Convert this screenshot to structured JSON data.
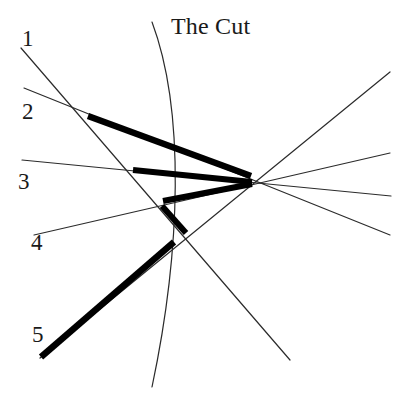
{
  "figure": {
    "title": "The Cut",
    "title_position": {
      "x": 171,
      "y": 14
    },
    "background_color": "#ffffff",
    "ink_color": "#1a1a1a",
    "thin_line_color": "#2b2b2b",
    "thick_line_color": "#000000",
    "width": 407,
    "height": 395
  },
  "convergence_point": {
    "x": 253,
    "y": 181
  },
  "labels": [
    {
      "name": "1",
      "x": 22,
      "y": 27
    },
    {
      "name": "2",
      "x": 22,
      "y": 100
    },
    {
      "name": "3",
      "x": 18,
      "y": 170
    },
    {
      "name": "4",
      "x": 31,
      "y": 231
    },
    {
      "name": "5",
      "x": 32,
      "y": 323
    }
  ],
  "cut_curve": {
    "label": "The Cut",
    "start": {
      "x": 152,
      "y": 22
    },
    "control1": {
      "x": 185,
      "y": 110
    },
    "control2": {
      "x": 181,
      "y": 250
    },
    "end": {
      "x": 152,
      "y": 387
    },
    "stroke_width": 1.2
  },
  "thin_lines": [
    {
      "name": "ray-1",
      "x1": 21,
      "y1": 48,
      "x2": 290,
      "y2": 360,
      "stroke_width": 1.2
    },
    {
      "name": "ray-2",
      "x1": 24,
      "y1": 88,
      "x2": 390,
      "y2": 235,
      "stroke_width": 1.2
    },
    {
      "name": "ray-3",
      "x1": 22,
      "y1": 160,
      "x2": 391,
      "y2": 196,
      "stroke_width": 1.2
    },
    {
      "name": "ray-4",
      "x1": 34,
      "y1": 235,
      "x2": 390,
      "y2": 153,
      "stroke_width": 1.2
    },
    {
      "name": "ray-5",
      "x1": 40,
      "y1": 358,
      "x2": 390,
      "y2": 72,
      "stroke_width": 1.2
    }
  ],
  "thick_segments": [
    {
      "name": "chord-1",
      "x1": 88,
      "y1": 116,
      "x2": 251,
      "y2": 176,
      "stroke_width": 6.5
    },
    {
      "name": "chord-2",
      "x1": 133,
      "y1": 170,
      "x2": 252,
      "y2": 182,
      "stroke_width": 6.0
    },
    {
      "name": "chord-3",
      "x1": 163,
      "y1": 201,
      "x2": 252,
      "y2": 184,
      "stroke_width": 6.0
    },
    {
      "name": "chord-4",
      "x1": 162,
      "y1": 206,
      "x2": 186,
      "y2": 233,
      "stroke_width": 6.0
    },
    {
      "name": "chord-5",
      "x1": 41,
      "y1": 357,
      "x2": 174,
      "y2": 242,
      "stroke_width": 6.5
    }
  ],
  "type": "line-diagram"
}
